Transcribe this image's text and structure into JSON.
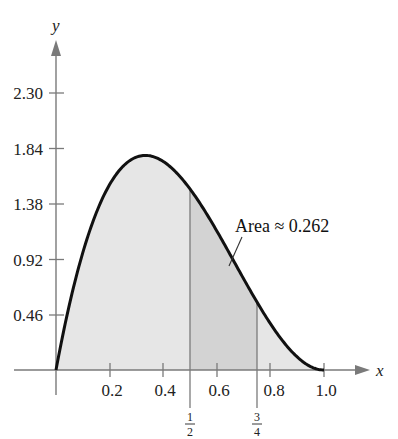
{
  "chart_data": {
    "type": "area",
    "title": "",
    "function": "f(x) = 12x(1-x)^2",
    "xlabel": "x",
    "ylabel": "y",
    "xlim": [
      0,
      1.0
    ],
    "ylim": [
      0,
      2.3
    ],
    "x_ticks": [
      0.2,
      0.4,
      0.6,
      0.8,
      1.0
    ],
    "x_tick_labels": [
      "0.2",
      "0.4",
      "0.6",
      "0.8",
      "1.0"
    ],
    "y_ticks": [
      0.46,
      0.92,
      1.38,
      1.84,
      2.3
    ],
    "y_tick_labels": [
      "0.46",
      "0.92",
      "1.38",
      "1.84",
      "2.30"
    ],
    "x": [
      0,
      0.05,
      0.1,
      0.15,
      0.2,
      0.25,
      0.3,
      0.333,
      0.35,
      0.4,
      0.45,
      0.5,
      0.55,
      0.6,
      0.65,
      0.7,
      0.75,
      0.8,
      0.85,
      0.9,
      0.95,
      1.0
    ],
    "y": [
      0,
      0.542,
      0.972,
      1.301,
      1.536,
      1.688,
      1.764,
      1.778,
      1.775,
      1.728,
      1.634,
      1.5,
      1.337,
      1.152,
      0.956,
      0.756,
      0.5625,
      0.384,
      0.2295,
      0.108,
      0.0285,
      0
    ],
    "shaded_region": {
      "from": 0.5,
      "to": 0.75,
      "area": 0.262
    },
    "vertical_markers": [
      {
        "x": 0.5,
        "label_num": "1",
        "label_den": "2"
      },
      {
        "x": 0.75,
        "label_num": "3",
        "label_den": "4"
      }
    ],
    "annotation": {
      "text": "Area ≈ 0.262"
    },
    "grid": false,
    "legend": null
  },
  "labels": {
    "x_axis": "x",
    "y_axis": "y",
    "annotation": "Area ≈ 0.262",
    "y_ticks": [
      "2.30",
      "1.84",
      "1.38",
      "0.92",
      "0.46"
    ],
    "x_ticks": [
      "0.2",
      "0.4",
      "0.6",
      "0.8",
      "1.0"
    ],
    "half_num": "1",
    "half_den": "2",
    "threeq_num": "3",
    "threeq_den": "4"
  },
  "colors": {
    "curve": "#111111",
    "axis": "#7a7a7a",
    "fill_full": "#e6e6e6",
    "fill_region": "#d3d3d3"
  }
}
